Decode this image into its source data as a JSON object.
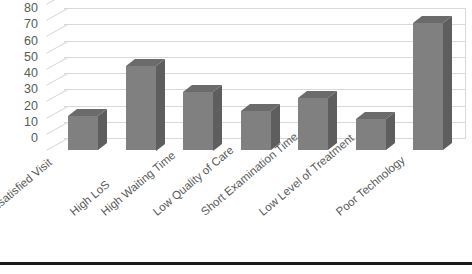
{
  "chart_data": {
    "type": "bar",
    "title": "",
    "subtitle": "",
    "xlabel": "",
    "ylabel": "",
    "ylim": [
      0,
      80
    ],
    "grid": true,
    "legend": false,
    "style": "3d-column",
    "bar_color": "#808080",
    "gridline_color": "#d9d9d9",
    "text_color": "#595959",
    "categories": [
      "Unsatisfied Visit",
      "High LoS",
      "High Waiting Time",
      "Low Quality of Care",
      "Short Examination Time",
      "Low Level of Treatment",
      "Poor Technology"
    ],
    "values": [
      21,
      52,
      36,
      24,
      32,
      19,
      78
    ],
    "ytick_labels": [
      "80",
      "70",
      "60",
      "50",
      "40",
      "30",
      "20",
      "10",
      "0"
    ],
    "ytick_values": [
      80,
      70,
      60,
      50,
      40,
      30,
      20,
      10,
      0
    ]
  }
}
